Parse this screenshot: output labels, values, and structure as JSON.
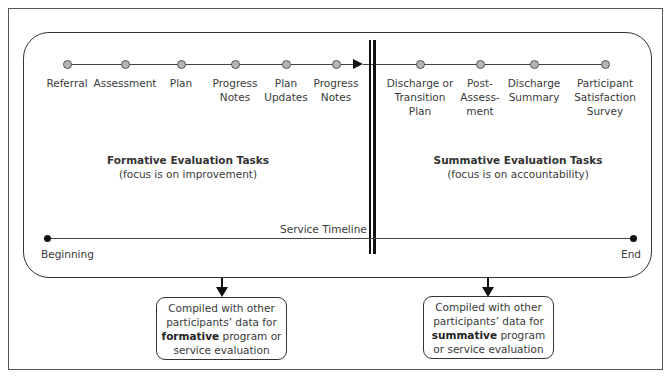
{
  "diagram": {
    "top_timeline": {
      "formative_steps": [
        {
          "label": "Referral",
          "x": 67
        },
        {
          "label": "Assessment",
          "x": 125
        },
        {
          "label": "Plan",
          "x": 181
        },
        {
          "label": "Progress\nNotes",
          "x": 235
        },
        {
          "label": "Plan\nUpdates",
          "x": 286
        },
        {
          "label": "Progress\nNotes",
          "x": 336
        }
      ],
      "summative_steps": [
        {
          "label": "Discharge or\nTransition\nPlan",
          "x": 420
        },
        {
          "label": "Post-\nAssess-\nment",
          "x": 480
        },
        {
          "label": "Discharge\nSummary",
          "x": 534
        },
        {
          "label": "Participant\nSatisfaction\nSurvey",
          "x": 605
        }
      ]
    },
    "formative": {
      "title": "Formative Evaluation Tasks",
      "subtitle": "(focus is on improvement)"
    },
    "summative": {
      "title": "Summative Evaluation Tasks",
      "subtitle": "(focus is on accountability)"
    },
    "service_timeline": {
      "label": "Service Timeline",
      "start_label": "Beginning",
      "end_label": "End"
    },
    "outputs": {
      "formative_box": {
        "line1": "Compiled with other",
        "line2": "participants’ data for",
        "bold": "formative",
        "line3_rest": " program or",
        "line4": "service evaluation"
      },
      "summative_box": {
        "line1": "Compiled with other",
        "line2": "participants’ data for",
        "bold": "summative",
        "line3_rest": " program",
        "line4": "or service evaluation"
      }
    }
  }
}
